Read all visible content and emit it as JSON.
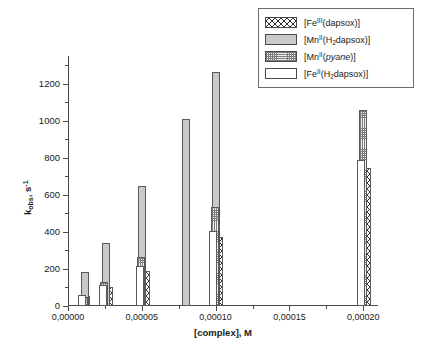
{
  "chart_data": {
    "type": "bar",
    "title": "",
    "xlabel": "[complex], M",
    "ylabel": "k_obs, s^-1",
    "ylabel_parts": {
      "base": "k",
      "sub": "obs",
      "tail": ", s",
      "sup": "-1"
    },
    "xlim": [
      0.0,
      0.00021
    ],
    "ylim": [
      0,
      1350
    ],
    "grid": false,
    "legend_position": "top-right",
    "y_ticks": [
      0,
      200,
      400,
      600,
      800,
      1000,
      1200
    ],
    "y_tick_labels": [
      "0",
      "200",
      "400",
      "600",
      "800",
      "1000",
      "1200"
    ],
    "y_minor_ticks": [
      100,
      300,
      500,
      700,
      900,
      1100,
      1300
    ],
    "x_ticks": [
      0.0,
      5e-05,
      0.0001,
      0.00015,
      0.0002
    ],
    "x_tick_labels": [
      "0,00000",
      "0,00005",
      "0,00010",
      "0,00015",
      "0,00020"
    ],
    "x_minor_ticks": [
      2.5e-05,
      7.5e-05,
      0.000125,
      0.000175
    ],
    "series": [
      {
        "name": "[Fe(III)(dapsox)]",
        "label_parts": {
          "pre": "[Fe",
          "sup": "III",
          "post": "(dapsox)]"
        },
        "pattern": "crosshatch",
        "color": "#ffffff",
        "points": [
          {
            "x": 1.25e-05,
            "y": 55
          },
          {
            "x": 2.75e-05,
            "y": 100
          },
          {
            "x": 5.25e-05,
            "y": 190
          },
          {
            "x": 0.0001025,
            "y": 375
          },
          {
            "x": 0.0002025,
            "y": 745
          }
        ]
      },
      {
        "name": "[Mn(II)(H2dapsox)]",
        "label_parts": {
          "pre": "[Mn",
          "sup": "II",
          "mid": "(H",
          "sub": "2",
          "post": "dapsox)]"
        },
        "pattern": "solid-gray",
        "color": "#c9c9c9",
        "points": [
          {
            "x": 1.15e-05,
            "y": 182
          },
          {
            "x": 2.55e-05,
            "y": 341
          },
          {
            "x": 5e-05,
            "y": 650
          },
          {
            "x": 8e-05,
            "y": 1008
          },
          {
            "x": 0.0001,
            "y": 1265
          }
        ]
      },
      {
        "name": "[Mn(II)(pyane)]",
        "label_parts": {
          "pre": "[Mn",
          "sup": "II",
          "post": "(",
          "italic": "pyane",
          "end": ")]"
        },
        "pattern": "fine-stipple",
        "color": "#f0f0f0",
        "points": [
          {
            "x": 1.05e-05,
            "y": 48
          },
          {
            "x": 2.45e-05,
            "y": 128
          },
          {
            "x": 4.95e-05,
            "y": 262
          },
          {
            "x": 9.95e-05,
            "y": 535
          },
          {
            "x": 0.0001995,
            "y": 1060
          }
        ]
      },
      {
        "name": "[Fe(II)(H2dapsox)]",
        "label_parts": {
          "pre": "[Fe",
          "sup": "II",
          "mid": "(H",
          "sub": "2",
          "post": "dapsox)]"
        },
        "pattern": "white",
        "color": "#ffffff",
        "points": [
          {
            "x": 9.5e-06,
            "y": 60
          },
          {
            "x": 2.35e-05,
            "y": 113
          },
          {
            "x": 4.85e-05,
            "y": 215
          },
          {
            "x": 9.85e-05,
            "y": 405
          },
          {
            "x": 0.0001985,
            "y": 788
          }
        ]
      }
    ]
  }
}
